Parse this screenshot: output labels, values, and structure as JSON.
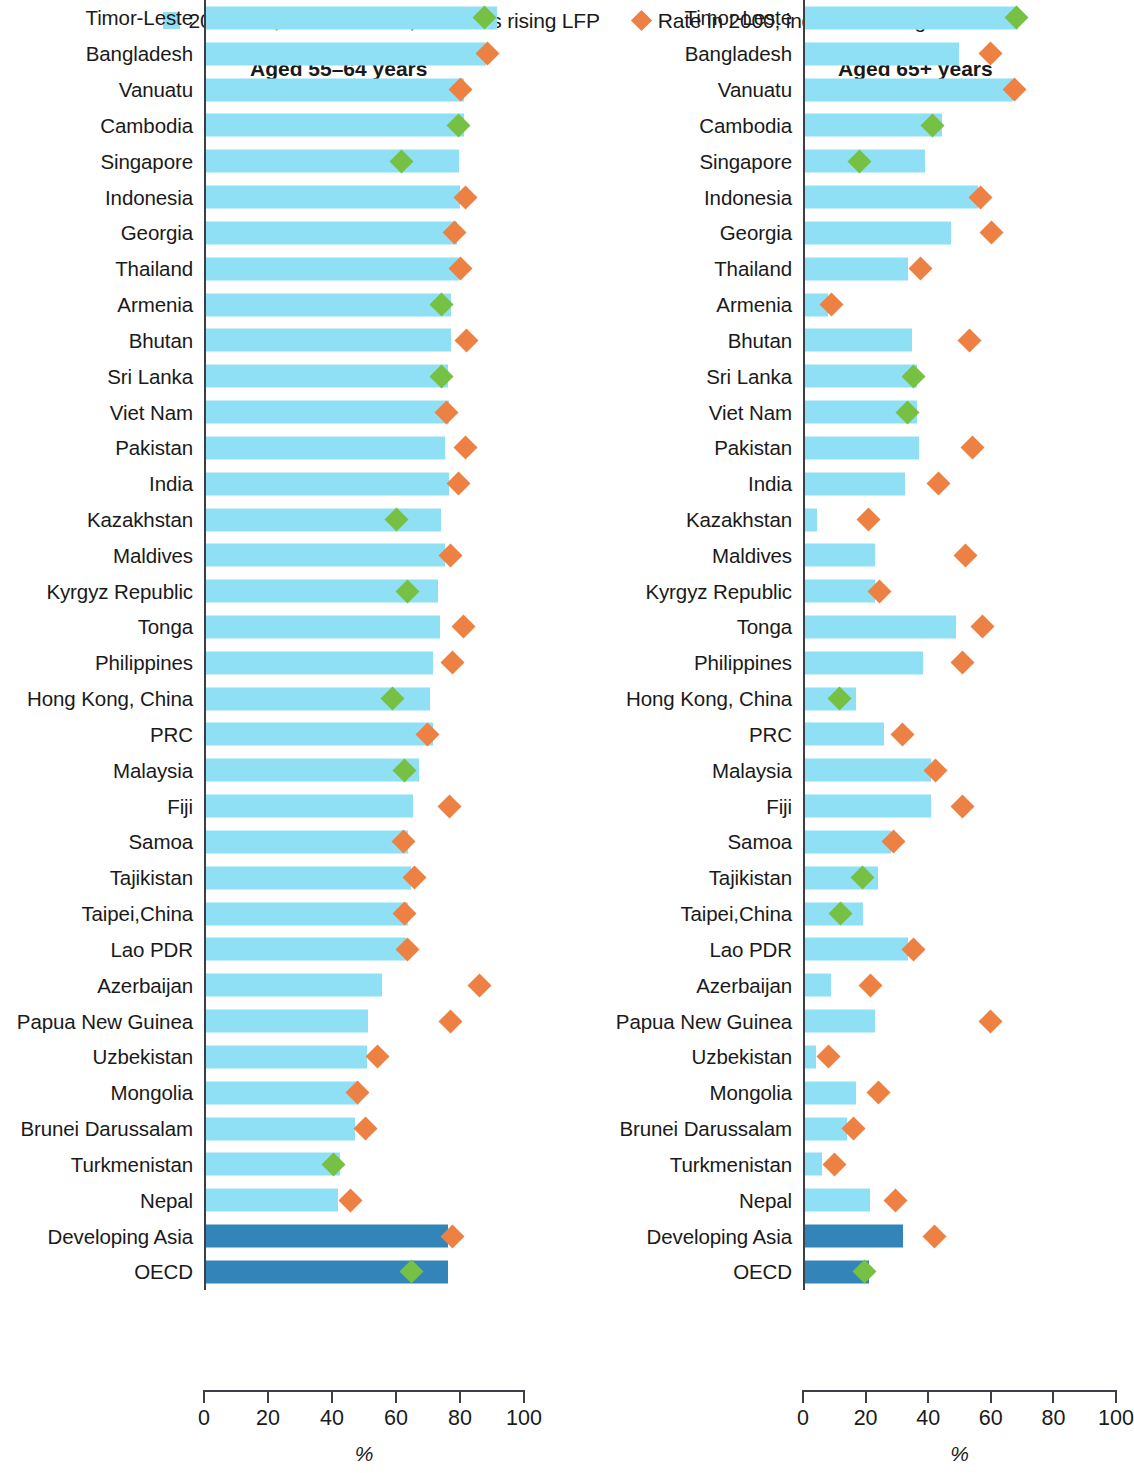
{
  "legend": {
    "items": [
      {
        "kind": "swatch",
        "icon": "square-swatch-icon",
        "label": "2021",
        "color": "#8FE0F5"
      },
      {
        "kind": "diamond",
        "icon": "green-diamond-icon",
        "label": "Rate in 2000, indicates rising LFP",
        "color": "#76C044"
      },
      {
        "kind": "diamond",
        "icon": "orange-diamond-icon",
        "label": "Rate in 2000, indicates falling LFP",
        "color": "#ED8043"
      }
    ]
  },
  "colors": {
    "bar_2021": "#8FE0F5",
    "bar_aggregate": "#3384B8",
    "rising": "#76C044",
    "falling": "#ED8043",
    "axis": "#3c3f46"
  },
  "panels": {
    "left": {
      "title": "Aged 55–64 years",
      "unit": "%"
    },
    "right": {
      "title": "Aged 65+ years",
      "unit": "%"
    }
  },
  "axis": {
    "ticks": [
      0,
      20,
      40,
      60,
      80,
      100
    ],
    "min": 0,
    "max": 100,
    "unit": "%"
  },
  "chart_data": {
    "type": "bar",
    "subtitle": "",
    "xlabel": "%",
    "ylabel": "",
    "xlim": [
      0,
      100
    ],
    "grid": false,
    "legend_position": "top",
    "series": [
      {
        "name": "2021",
        "type": "bar",
        "color": "#8FE0F5"
      },
      {
        "name": "Rate in 2000, indicates rising LFP",
        "type": "marker",
        "color": "#76C044"
      },
      {
        "name": "Rate in 2000, indicates falling LFP",
        "type": "marker",
        "color": "#ED8043"
      }
    ],
    "panels": [
      {
        "key": "left",
        "title": "Aged 55–64 years",
        "categories": [
          "Timor-Leste",
          "Bangladesh",
          "Vanuatu",
          "Cambodia",
          "Singapore",
          "Indonesia",
          "Georgia",
          "Thailand",
          "Armenia",
          "Bhutan",
          "Sri Lanka",
          "Viet Nam",
          "Pakistan",
          "India",
          "Kazakhstan",
          "Maldives",
          "Kyrgyz Republic",
          "Tonga",
          "Philippines",
          "Hong Kong, China",
          "PRC",
          "Malaysia",
          "Fiji",
          "Samoa",
          "Tajikistan",
          "Taipei,China",
          "Lao PDR",
          "Azerbaijan",
          "Papua New Guinea",
          "Uzbekistan",
          "Mongolia",
          "Brunei Darussalam",
          "Turkmenistan",
          "Nepal",
          "Developing Asia",
          "OECD"
        ],
        "values_2021": [
          91.5,
          88.0,
          81.0,
          81.0,
          79.5,
          80.0,
          79.0,
          79.5,
          77.0,
          77.0,
          76.0,
          76.5,
          75.0,
          76.5,
          74.0,
          75.0,
          73.0,
          73.5,
          71.5,
          70.5,
          71.5,
          67.0,
          65.0,
          63.5,
          64.5,
          63.5,
          63.0,
          55.5,
          51.0,
          50.5,
          48.0,
          47.0,
          42.0,
          41.5,
          76.0,
          76.0
        ],
        "values_2000": [
          87.5,
          88.5,
          80.0,
          79.5,
          61.5,
          81.5,
          78.0,
          80.0,
          74.0,
          82.0,
          74.0,
          75.5,
          81.5,
          79.5,
          60.0,
          77.0,
          63.5,
          81.0,
          77.5,
          58.5,
          69.5,
          62.5,
          76.5,
          62.0,
          65.5,
          62.5,
          63.5,
          86.0,
          77.0,
          54.0,
          47.5,
          50.0,
          40.0,
          45.5,
          77.5,
          64.5
        ],
        "direction_2000": [
          "rising",
          "falling",
          "falling",
          "rising",
          "rising",
          "falling",
          "falling",
          "falling",
          "rising",
          "falling",
          "rising",
          "falling",
          "falling",
          "falling",
          "rising",
          "falling",
          "rising",
          "falling",
          "falling",
          "rising",
          "falling",
          "rising",
          "falling",
          "falling",
          "falling",
          "falling",
          "falling",
          "falling",
          "falling",
          "falling",
          "falling",
          "falling",
          "rising",
          "falling",
          "falling",
          "rising"
        ],
        "aggregate_rows": [
          "Developing Asia",
          "OECD"
        ]
      },
      {
        "key": "right",
        "title": "Aged 65+ years",
        "categories": [
          "Timor-Leste",
          "Bangladesh",
          "Vanuatu",
          "Cambodia",
          "Singapore",
          "Indonesia",
          "Georgia",
          "Thailand",
          "Armenia",
          "Bhutan",
          "Sri Lanka",
          "Viet Nam",
          "Pakistan",
          "India",
          "Kazakhstan",
          "Maldives",
          "Kyrgyz Republic",
          "Tonga",
          "Philippines",
          "Hong Kong, China",
          "PRC",
          "Malaysia",
          "Fiji",
          "Samoa",
          "Tajikistan",
          "Taipei,China",
          "Lao PDR",
          "Azerbaijan",
          "Papua New Guinea",
          "Uzbekistan",
          "Mongolia",
          "Brunei Darussalam",
          "Turkmenistan",
          "Nepal",
          "Developing Asia",
          "OECD"
        ],
        "values_2021": [
          68.5,
          49.5,
          67.0,
          44.0,
          38.5,
          55.5,
          47.0,
          33.0,
          7.5,
          34.5,
          36.0,
          36.0,
          36.5,
          32.0,
          4.0,
          22.5,
          22.5,
          48.5,
          38.0,
          16.5,
          25.5,
          40.5,
          40.5,
          27.5,
          23.5,
          18.5,
          33.0,
          8.5,
          22.5,
          3.5,
          16.5,
          13.5,
          5.5,
          21.0,
          31.5,
          20.5
        ],
        "values_2000": [
          68.0,
          59.5,
          67.5,
          41.0,
          17.5,
          56.5,
          60.0,
          37.0,
          8.5,
          53.0,
          35.0,
          33.0,
          54.0,
          43.0,
          20.5,
          51.5,
          24.0,
          57.0,
          50.5,
          11.0,
          31.5,
          42.0,
          50.5,
          28.5,
          18.5,
          11.5,
          35.0,
          21.0,
          59.5,
          7.5,
          23.5,
          15.5,
          9.5,
          29.0,
          41.5,
          19.0
        ],
        "direction_2000": [
          "rising",
          "falling",
          "falling",
          "rising",
          "rising",
          "falling",
          "falling",
          "falling",
          "falling",
          "falling",
          "rising",
          "rising",
          "falling",
          "falling",
          "falling",
          "falling",
          "falling",
          "falling",
          "falling",
          "rising",
          "falling",
          "falling",
          "falling",
          "falling",
          "rising",
          "rising",
          "falling",
          "falling",
          "falling",
          "falling",
          "falling",
          "falling",
          "falling",
          "falling",
          "falling",
          "rising"
        ],
        "aggregate_rows": [
          "Developing Asia",
          "OECD"
        ]
      }
    ]
  }
}
